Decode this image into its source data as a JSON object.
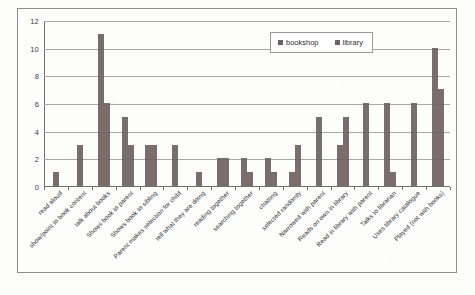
{
  "chart_data": {
    "type": "bar",
    "title": "",
    "subtitle": "",
    "xlabel": "",
    "ylabel": "",
    "ylim": [
      0,
      12
    ],
    "yticks": [
      0,
      2,
      4,
      6,
      8,
      10,
      12
    ],
    "grid": true,
    "legend_position": "top-right-inside",
    "orientation": "vertical",
    "grouping": "grouped",
    "categories": [
      "read aloud",
      "show/point to book content",
      "talk about books",
      "Shows book to parent",
      "Shows book to sibling",
      "Parent makes selection for child",
      "tell what they are doing",
      "reading together",
      "searching together",
      "chatting",
      "selected randomly",
      "Narrowed with parent",
      "Reads on own in library",
      "Read in library with parent",
      "Talks to librarian",
      "Uses library catalogue",
      "Played (not with books)"
    ],
    "series": [
      {
        "name": "bookshop",
        "color": "#6e6260",
        "values": [
          1,
          3,
          11,
          5,
          3,
          0,
          1,
          2,
          2,
          2,
          1,
          5,
          3,
          6,
          6,
          6,
          10
        ]
      },
      {
        "name": "library",
        "color": "#6e6260",
        "values": [
          0,
          0,
          6,
          3,
          3,
          3,
          0,
          2,
          1,
          1,
          3,
          0,
          5,
          0,
          1,
          0,
          7
        ]
      }
    ]
  },
  "legend": {
    "entries": [
      {
        "label": "bookshop"
      },
      {
        "label": "library"
      }
    ]
  },
  "axes": {
    "y_tick_labels": [
      "0",
      "2",
      "4",
      "6",
      "8",
      "10",
      "12"
    ]
  },
  "colors": {
    "bar": "#6e6260",
    "gridline": "#a8a8a8",
    "axis": "#6f6f6f",
    "frame_border": "#8d8d8d",
    "text": "#303030",
    "background": "#fdfdfc"
  }
}
